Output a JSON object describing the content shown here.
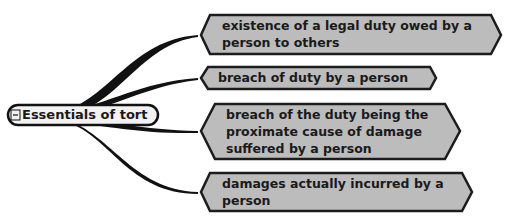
{
  "mindmap": {
    "root": {
      "label": "Essentials of tort",
      "toggle_symbol": "−"
    },
    "branches": [
      {
        "label": "existence of a legal duty owed by a\nperson to others"
      },
      {
        "label": "breach of duty by a person"
      },
      {
        "label": "breach of the duty being the\nproximate cause of damage\nsuffered by a person"
      },
      {
        "label": "damages actually incurred by a\nperson"
      }
    ]
  },
  "colors": {
    "node_fill": "#bcbcbc",
    "node_border": "#1c1c1c",
    "connector": "#111111",
    "root_fill": "#f2f2f2",
    "background": "#ffffff"
  }
}
